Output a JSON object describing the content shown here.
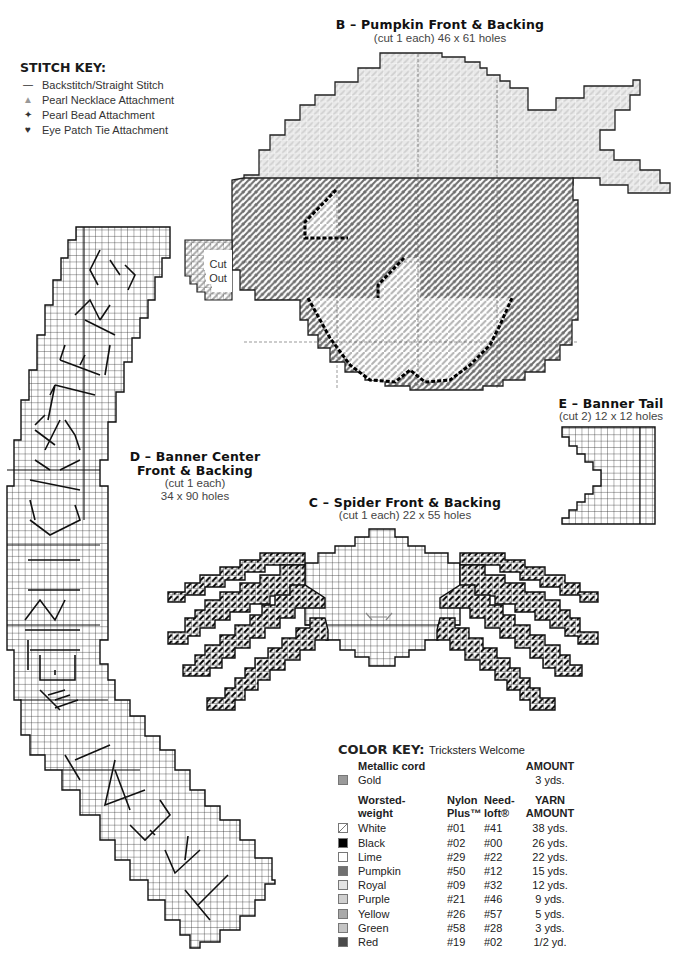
{
  "stitch_key": {
    "title": "STITCH KEY:",
    "items": [
      {
        "icon": "line-icon",
        "glyph": "—",
        "label": "Backstitch/Straight Stitch"
      },
      {
        "icon": "triangle-icon",
        "glyph": "▲",
        "label": "Pearl Necklace Attachment"
      },
      {
        "icon": "diamond-star-icon",
        "glyph": "✦",
        "label": "Pearl Bead Attachment"
      },
      {
        "icon": "heart-icon",
        "glyph": "♥",
        "label": "Eye Patch Tie Attachment"
      }
    ]
  },
  "pieces": {
    "b": {
      "title": "B – Pumpkin Front & Backing",
      "subtitle": "(cut 1 each) 46 x 61 holes",
      "cutout_label_1": "Cut",
      "cutout_label_2": "Out"
    },
    "c": {
      "title": "C – Spider Front & Backing",
      "subtitle": "(cut 1 each) 22 x 55 holes"
    },
    "d": {
      "title_1": "D – Banner Center",
      "title_2": "Front & Backing",
      "subtitle_1": "(cut 1 each)",
      "subtitle_2": "34 x 90 holes",
      "letters": "TRICKSTERS WELCOME"
    },
    "e": {
      "title": "E – Banner Tail",
      "subtitle": "(cut 2) 12 x 12 holes"
    }
  },
  "color_key": {
    "title": "COLOR KEY:",
    "project": "Tricksters Welcome",
    "metallic": {
      "header": "Metallic cord",
      "amount_header": "AMOUNT",
      "items": [
        {
          "name": "Gold",
          "amount": "3 yds.",
          "swatch": "#9a9a9a"
        }
      ]
    },
    "yarn": {
      "headers": {
        "col1_a": "Worsted-",
        "col1_b": "weight",
        "col2_a": "Nylon",
        "col2_b": "Plus™",
        "col3_a": "Need-",
        "col3_b": "loft®",
        "col4_a": "YARN",
        "col4_b": "AMOUNT"
      },
      "items": [
        {
          "name": "White",
          "nylon": "#01",
          "needloft": "#41",
          "amount": "38 yds.",
          "swatch": "hatch"
        },
        {
          "name": "Black",
          "nylon": "#02",
          "needloft": "#00",
          "amount": "26 yds.",
          "swatch": "#000000"
        },
        {
          "name": "Lime",
          "nylon": "#29",
          "needloft": "#22",
          "amount": "22 yds.",
          "swatch": "#ffffff"
        },
        {
          "name": "Pumpkin",
          "nylon": "#50",
          "needloft": "#12",
          "amount": "15 yds.",
          "swatch": "#707070"
        },
        {
          "name": "Royal",
          "nylon": "#09",
          "needloft": "#32",
          "amount": "12 yds.",
          "swatch": "#e4e4e4"
        },
        {
          "name": "Purple",
          "nylon": "#21",
          "needloft": "#46",
          "amount": "9 yds.",
          "swatch": "#cfcfcf"
        },
        {
          "name": "Yellow",
          "nylon": "#26",
          "needloft": "#57",
          "amount": "5 yds.",
          "swatch": "#a9a9a9"
        },
        {
          "name": "Green",
          "nylon": "#58",
          "needloft": "#28",
          "amount": "3 yds.",
          "swatch": "#c4c4c4"
        },
        {
          "name": "Red",
          "nylon": "#19",
          "needloft": "#02",
          "amount": "1/2 yd.",
          "swatch": "#4a4a4a"
        }
      ]
    }
  }
}
